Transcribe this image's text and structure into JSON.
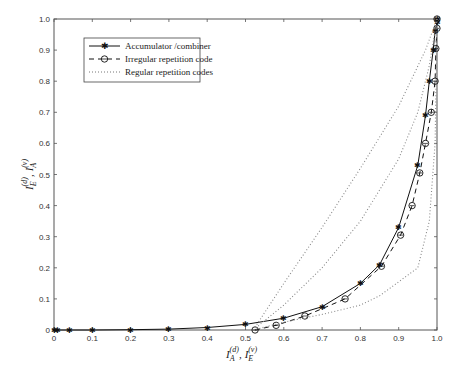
{
  "chart_data": {
    "type": "line",
    "title": "",
    "xlabel": "I_A^(d), I_E^(v)",
    "ylabel": "I_E^(d), I_A^(v)",
    "xlim": [
      0,
      1.0
    ],
    "ylim": [
      0,
      1.0
    ],
    "grid": false,
    "legend_position": "upper left",
    "x_ticks": [
      "0",
      "0.1",
      "0.2",
      "0.3",
      "0.4",
      "0.5",
      "0.6",
      "0.7",
      "0.8",
      "0.9",
      "1.0"
    ],
    "y_ticks": [
      "0",
      "0.1",
      "0.2",
      "0.3",
      "0.4",
      "0.5",
      "0.6",
      "0.7",
      "0.8",
      "0.9",
      "1.0"
    ],
    "series": [
      {
        "name": "Accumulator /combiner",
        "style": "solid",
        "marker": "star",
        "x": [
          0,
          0.01,
          0.04,
          0.1,
          0.2,
          0.3,
          0.4,
          0.5,
          0.6,
          0.7,
          0.8,
          0.85,
          0.9,
          0.95,
          0.97,
          0.98,
          0.99,
          0.995,
          1.0,
          1.0
        ],
        "y": [
          0,
          0,
          0,
          0,
          0.001,
          0.003,
          0.008,
          0.018,
          0.038,
          0.075,
          0.15,
          0.21,
          0.33,
          0.53,
          0.69,
          0.8,
          0.9,
          0.96,
          0.99,
          1.0
        ]
      },
      {
        "name": "Irregular repetition code",
        "style": "dashed",
        "marker": "circle",
        "x": [
          0.525,
          0.58,
          0.655,
          0.76,
          0.855,
          0.905,
          0.935,
          0.955,
          0.97,
          0.985,
          0.995,
          0.997,
          1.0,
          1.0
        ],
        "y": [
          0.0,
          0.015,
          0.045,
          0.1,
          0.205,
          0.305,
          0.4,
          0.505,
          0.6,
          0.7,
          0.8,
          0.905,
          0.97,
          1.0
        ]
      },
      {
        "name": "Regular repetition codes",
        "style": "dotted",
        "marker": "none",
        "x": [
          0.52,
          0.6,
          0.7,
          0.8,
          0.9,
          0.97,
          1.0
        ],
        "y": [
          0.0,
          0.15,
          0.33,
          0.52,
          0.72,
          0.9,
          1.0
        ]
      },
      {
        "name": "Regular repetition codes (2)",
        "style": "dotted",
        "marker": "none",
        "x": [
          0.52,
          0.6,
          0.7,
          0.8,
          0.9,
          0.95,
          0.98,
          1.0
        ],
        "y": [
          0.0,
          0.08,
          0.2,
          0.35,
          0.55,
          0.7,
          0.85,
          1.0
        ]
      },
      {
        "name": "Regular repetition codes (3)",
        "style": "dotted",
        "marker": "none",
        "x": [
          0.52,
          0.6,
          0.7,
          0.8,
          0.85,
          0.95,
          0.98,
          0.995,
          1.0
        ],
        "y": [
          0.0,
          0.025,
          0.05,
          0.08,
          0.11,
          0.2,
          0.35,
          0.6,
          1.0
        ]
      }
    ]
  },
  "legend": {
    "items": [
      {
        "label": "Accumulator /combiner"
      },
      {
        "label": "Irregular repetition code"
      },
      {
        "label": "Regular repetition codes"
      }
    ]
  },
  "axes": {
    "xlabel_main": "I",
    "xlabel_sub1": "A",
    "xlabel_sup1": "(d)",
    "xlabel_sep": ",",
    "xlabel_sub2": "E",
    "xlabel_sup2": "(v)",
    "ylabel_sub1": "E",
    "ylabel_sup1": "(d)",
    "ylabel_sub2": "A",
    "ylabel_sup2": "(v)"
  }
}
